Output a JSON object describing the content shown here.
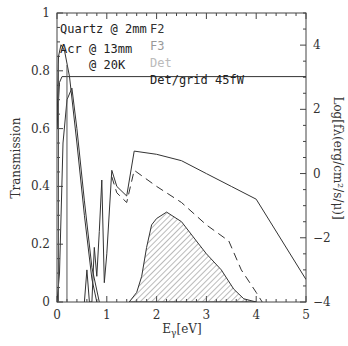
{
  "chart_data": {
    "type": "line",
    "title": "",
    "xlabel": "Eγ[eV]",
    "xlabel_main": "E",
    "xlabel_sub": "γ",
    "xlabel_unit": "[eV]",
    "ylabel": "Transmission",
    "ylabel_right": "Log[fλ(erg/cm²/s/μ)]",
    "xlim": [
      0,
      5
    ],
    "ylim": [
      0,
      1
    ],
    "ylim_right": [
      -4,
      5
    ],
    "grid": false,
    "x_ticks": [
      "0",
      "1",
      "2",
      "3",
      "4",
      "5"
    ],
    "y_ticks": [
      "0",
      "0.2",
      "0.4",
      "0.6",
      "0.8",
      "1"
    ],
    "y_right_ticks": [
      "-4",
      "-2",
      "0",
      "2",
      "4"
    ],
    "legend": {
      "position": "upper-left-inside",
      "entries": [
        {
          "label": "Quartz @ 2mm",
          "color": "#222222"
        },
        {
          "label": "Acr @ 13mm",
          "color": "#222222"
        },
        {
          "label": "@ 20K",
          "color": "#222222"
        },
        {
          "label": "F2",
          "color": "#333333"
        },
        {
          "label": "F3",
          "color": "#999999"
        },
        {
          "label": "Det",
          "color": "#bbbbbb"
        },
        {
          "label": "Det/grid 45fW",
          "color": "#222222"
        }
      ]
    },
    "series": [
      {
        "name": "Quartz @ 2mm (transmission)",
        "style": "solid",
        "x": [
          0.0,
          0.03,
          0.08,
          0.15,
          0.25,
          0.4,
          0.55,
          0.7,
          0.8
        ],
        "y": [
          0.6,
          0.85,
          0.89,
          0.87,
          0.78,
          0.55,
          0.3,
          0.08,
          0.0
        ]
      },
      {
        "name": "Acr @ 13mm (transmission)",
        "style": "solid",
        "x": [
          0.0,
          0.05,
          0.12,
          0.2,
          0.3,
          0.4,
          0.55,
          0.7,
          0.85
        ],
        "y": [
          0.0,
          0.1,
          0.55,
          0.7,
          0.74,
          0.6,
          0.35,
          0.12,
          0.0
        ]
      },
      {
        "name": "Det/grid 45fW (flat)",
        "style": "solid",
        "x": [
          0.0,
          0.05,
          0.1,
          5.0
        ],
        "y": [
          0.6,
          0.76,
          0.78,
          0.78
        ]
      },
      {
        "name": "F2 (filter spectrum, log scale)",
        "style": "solid",
        "axis": "right",
        "x": [
          0.55,
          0.6,
          0.65,
          0.7,
          0.75,
          0.8,
          0.85,
          0.9,
          0.95,
          1.0,
          1.1,
          1.2,
          1.4,
          1.55,
          2.0,
          2.5,
          3.0,
          3.5,
          4.0,
          5.0
        ],
        "y": [
          -4.0,
          -3.0,
          -4.0,
          -4.0,
          -2.3,
          -3.2,
          -1.8,
          -0.2,
          -3.4,
          -2.5,
          0.1,
          -0.4,
          -0.7,
          0.7,
          0.6,
          0.4,
          0.0,
          -0.4,
          -0.8,
          -3.3
        ]
      },
      {
        "name": "F3 (filter spectrum, log scale, dashed)",
        "style": "dashed",
        "axis": "right",
        "x": [
          1.1,
          1.2,
          1.4,
          1.55,
          2.0,
          2.5,
          3.0,
          3.45,
          3.7,
          4.0,
          4.12
        ],
        "y": [
          -0.1,
          -0.6,
          -0.9,
          0.1,
          -0.4,
          -0.9,
          -1.6,
          -2.1,
          -3.0,
          -3.7,
          -4.0
        ]
      },
      {
        "name": "Det (hatched area, log scale)",
        "style": "hatched-area",
        "axis": "right",
        "x": [
          1.45,
          1.6,
          1.7,
          1.8,
          1.9,
          2.0,
          2.2,
          2.5,
          2.8,
          3.0,
          3.3,
          3.55,
          3.75,
          4.0
        ],
        "y": [
          -4.0,
          -3.7,
          -3.2,
          -2.3,
          -1.6,
          -1.4,
          -1.2,
          -1.5,
          -2.1,
          -2.5,
          -3.0,
          -3.6,
          -3.9,
          -4.0
        ]
      }
    ]
  }
}
